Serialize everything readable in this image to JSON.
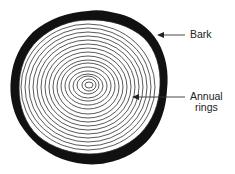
{
  "diagram": {
    "labels": {
      "bark": "Bark",
      "annual_rings_line1": "Annual",
      "annual_rings_line2": "rings"
    },
    "colors": {
      "ink": "#111111",
      "background": "#ffffff"
    }
  }
}
